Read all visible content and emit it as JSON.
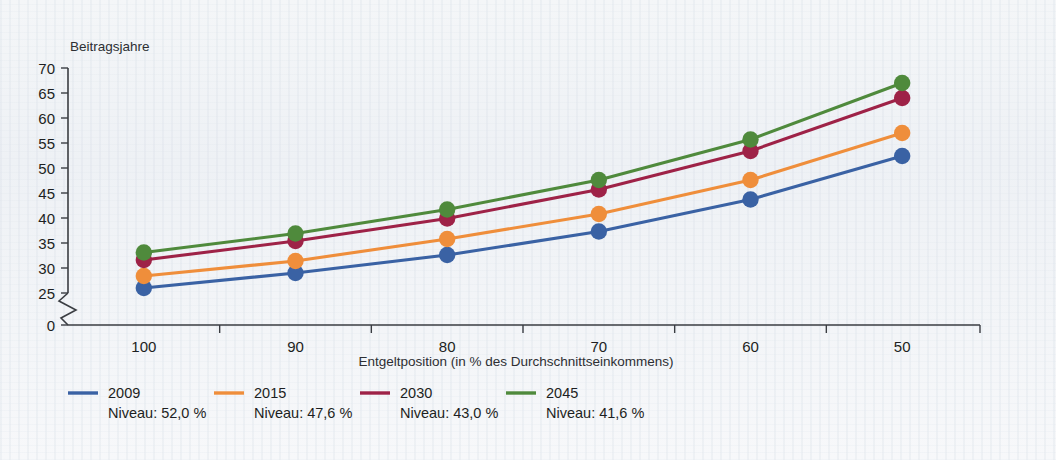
{
  "chart_data": {
    "type": "line",
    "title": "",
    "ylabel": "Beitragsjahre",
    "xlabel": "Entgeltposition (in % des Durchschnittseinkommens)",
    "categories": [
      "100",
      "90",
      "80",
      "70",
      "60",
      "50"
    ],
    "x_tick_labels": [
      "100",
      "90",
      "80",
      "70",
      "60",
      "50"
    ],
    "y_tick_labels": [
      "0",
      "25",
      "30",
      "35",
      "40",
      "45",
      "50",
      "55",
      "60",
      "65",
      "70"
    ],
    "ylim": [
      25,
      70
    ],
    "y_axis_break": true,
    "grid": false,
    "legend_position": "bottom-left",
    "series": [
      {
        "name": "2009",
        "sublabel": "Niveau: 52,0 %",
        "color": "#3a62a4",
        "values": [
          26.0,
          29.0,
          32.6,
          37.3,
          43.7,
          52.4
        ]
      },
      {
        "name": "2015",
        "sublabel": "Niveau: 47,6 %",
        "color": "#ef8e3b",
        "values": [
          28.4,
          31.4,
          35.8,
          40.8,
          47.6,
          57.0
        ]
      },
      {
        "name": "2030",
        "sublabel": "Niveau: 43,0 %",
        "color": "#9e2247",
        "values": [
          31.6,
          35.4,
          39.9,
          45.7,
          53.4,
          64.0
        ]
      },
      {
        "name": "2045",
        "sublabel": "Niveau: 41,6 %",
        "color": "#4f8a3c",
        "values": [
          33.1,
          36.9,
          41.7,
          47.6,
          55.7,
          67.0
        ]
      }
    ]
  },
  "legend": {
    "items": [
      {
        "label": "2009",
        "sublabel": "Niveau: 52,0 %",
        "color": "#3a62a4"
      },
      {
        "label": "2015",
        "sublabel": "Niveau: 47,6 %",
        "color": "#ef8e3b"
      },
      {
        "label": "2030",
        "sublabel": "Niveau: 43,0 %",
        "color": "#9e2247"
      },
      {
        "label": "2045",
        "sublabel": "Niveau: 41,6 %",
        "color": "#4f8a3c"
      }
    ]
  }
}
